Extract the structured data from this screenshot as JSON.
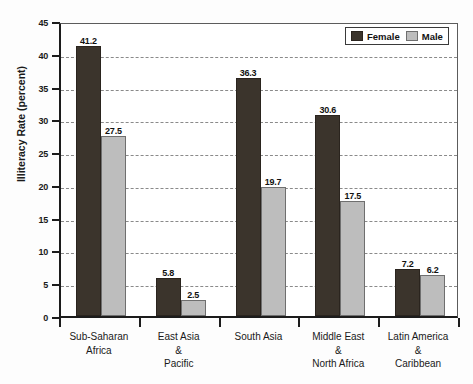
{
  "chart_data": {
    "type": "bar",
    "title": "",
    "xlabel": "",
    "ylabel": "Illiteracy Rate (percent)",
    "ylim": [
      0,
      45
    ],
    "ytick_step": 5,
    "yticks": [
      0,
      5,
      10,
      15,
      20,
      25,
      30,
      35,
      40,
      45
    ],
    "grid": true,
    "legend_position": "top-right",
    "categories": [
      "Sub-Saharan\nAfrica",
      "East Asia\n&\nPacific",
      "South Asia",
      "Middle East\n&\nNorth Africa",
      "Latin America\n&\nCaribbean"
    ],
    "category_lines": [
      [
        "Sub-Saharan",
        "Africa"
      ],
      [
        "East Asia",
        "&",
        "Pacific"
      ],
      [
        "South Asia"
      ],
      [
        "Middle East",
        "&",
        "North Africa"
      ],
      [
        "Latin America",
        "&",
        "Caribbean"
      ]
    ],
    "series": [
      {
        "name": "Female",
        "color": "#3b342c",
        "values": [
          41.2,
          5.8,
          36.3,
          30.6,
          7.2
        ]
      },
      {
        "name": "Male",
        "color": "#bdbdbd",
        "values": [
          27.5,
          2.5,
          19.7,
          17.5,
          6.2
        ]
      }
    ]
  },
  "legend": {
    "items": [
      {
        "label": "Female",
        "swatch": "female-swatch"
      },
      {
        "label": "Male",
        "swatch": "male-swatch"
      }
    ]
  },
  "colors": {
    "female_bar": "#3b342c",
    "male_bar": "#bdbdbd",
    "axis": "#1c1c1c",
    "gridline": "#8a8a8a",
    "background": "#ffffff"
  }
}
